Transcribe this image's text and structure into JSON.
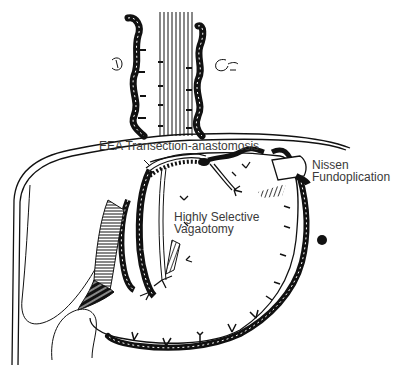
{
  "figure": {
    "ink_color": "#111111",
    "paper_color": "#ffffff",
    "label_color": "#3a3a3a"
  },
  "labels": {
    "eea": {
      "text": "EEA Transection-anastomosis"
    },
    "nissen": {
      "line1": "Nissen",
      "line2": "Fundoplication"
    },
    "hsv": {
      "line1": "Highly Selective",
      "line2": "Vagaotomy"
    }
  }
}
